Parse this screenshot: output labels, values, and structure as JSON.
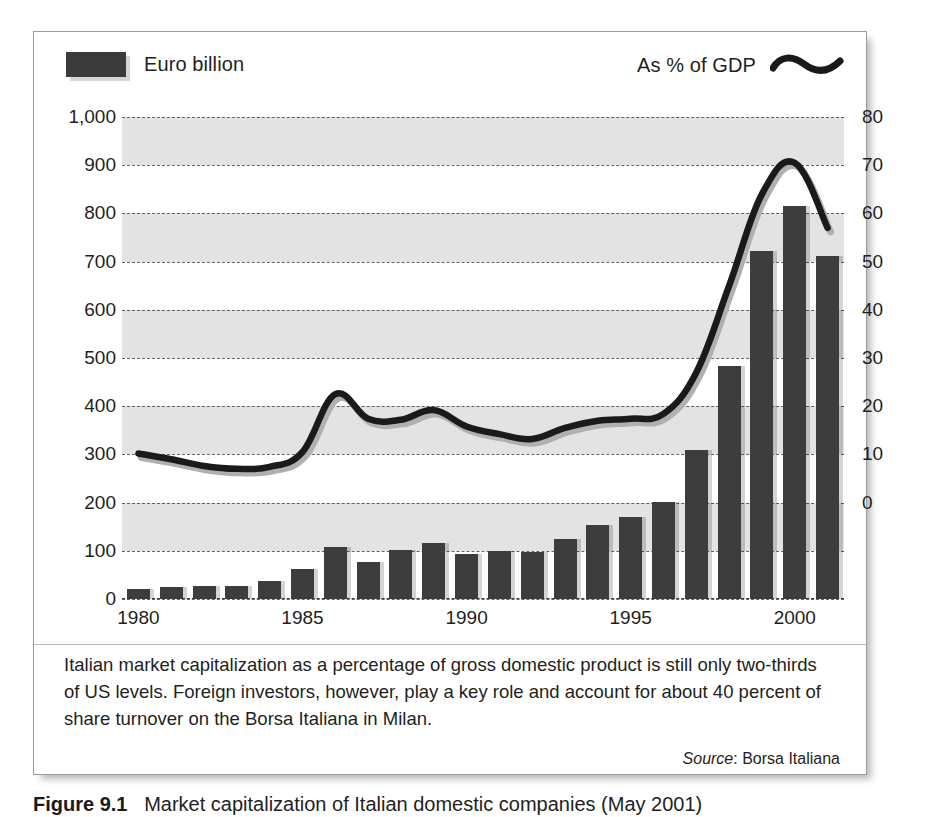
{
  "legend": {
    "bar_series_label": "Euro billion",
    "line_series_label": "As % of GDP",
    "bar_swatch_icon": "filled-rectangle-swatch",
    "line_swatch_icon": "wavy-line-swatch"
  },
  "caption": {
    "body": "Italian market capitalization as a percentage of gross domestic product is still only two-thirds of US levels. Foreign investors, however, play a key role and account for about 40 percent of share turnover on the Borsa Italiana in Milan.",
    "source_label": "Source",
    "source_value": "Borsa Italiana"
  },
  "figure_caption": {
    "number": "Figure 9.1",
    "text": "Market capitalization of Italian domestic companies (May 2001)"
  },
  "colors": {
    "bar_fill": "#3d3d3d",
    "line_stroke": "#1a1a1a",
    "band_fill": "#e3e3e3",
    "grid_stroke": "#4a4a4a",
    "frame_border": "#9a9a9a",
    "text": "#231f20"
  },
  "chart_data": {
    "type": "bar",
    "title": "Market capitalization of Italian domestic companies (May 2001)",
    "xlabel": "",
    "ylabel": "Euro billion",
    "y2label": "As % of GDP",
    "ylim": [
      0,
      1000
    ],
    "y2lim": [
      -20,
      80
    ],
    "ytick_values": [
      0,
      100,
      200,
      300,
      400,
      500,
      600,
      700,
      800,
      900,
      1000
    ],
    "ytick_labels": [
      "0",
      "100",
      "200",
      "300",
      "400",
      "500",
      "600",
      "700",
      "800",
      "900",
      "1,000"
    ],
    "y2tick_values": [
      -20,
      -10,
      0,
      10,
      20,
      30,
      40,
      50,
      60,
      70,
      80
    ],
    "y2tick_labels": [
      "-20",
      "-10",
      "0",
      "10",
      "20",
      "30",
      "40",
      "50",
      "60",
      "70",
      "80"
    ],
    "y2tick_labels_visible": [
      "0",
      "10",
      "20",
      "30",
      "40",
      "50",
      "60",
      "70",
      "80"
    ],
    "grid": true,
    "legend_position": "top",
    "x": [
      1980,
      1981,
      1982,
      1983,
      1984,
      1985,
      1986,
      1987,
      1988,
      1989,
      1990,
      1991,
      1992,
      1993,
      1994,
      1995,
      1996,
      1997,
      1998,
      1999,
      2000,
      2001
    ],
    "categories": [
      "1980",
      "1981",
      "1982",
      "1983",
      "1984",
      "1985",
      "1986",
      "1987",
      "1988",
      "1989",
      "1990",
      "1991",
      "1992",
      "1993",
      "1994",
      "1995",
      "1996",
      "1997",
      "1998",
      "1999",
      "2000",
      "2001"
    ],
    "xtick_labels_shown": [
      "1980",
      "1985",
      "1990",
      "1995",
      "2000"
    ],
    "xtick_label_years": [
      1980,
      1985,
      1990,
      1995,
      2000
    ],
    "series": [
      {
        "name": "Euro billion",
        "type": "bar",
        "axis": "left",
        "values": [
          20,
          25,
          26,
          28,
          37,
          62,
          108,
          77,
          102,
          117,
          94,
          100,
          97,
          124,
          153,
          171,
          201,
          310,
          484,
          722,
          815,
          712
        ]
      },
      {
        "name": "As % of GDP",
        "type": "line",
        "axis": "right",
        "values": [
          10.2,
          9.0,
          7.6,
          7.0,
          7.4,
          10.5,
          22.5,
          17.4,
          17.2,
          19.2,
          15.8,
          14.2,
          13.2,
          15.5,
          17.0,
          17.4,
          18.4,
          27.0,
          45.0,
          64.0,
          70.5,
          57.0
        ]
      }
    ]
  }
}
